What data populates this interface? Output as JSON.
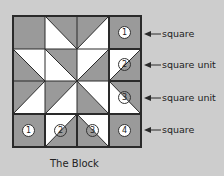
{
  "diagram": {
    "caption": "The Block",
    "colors": {
      "background": "#cdcdcd",
      "dark": "#9a9a9a",
      "light": "#ffffff",
      "line": "#2a2a2a"
    },
    "grid": {
      "rows": 4,
      "cols": 4
    },
    "labels": [
      {
        "text": "square",
        "row": 0
      },
      {
        "text": "square unit",
        "row": 1
      },
      {
        "text": "square unit",
        "row": 2
      },
      {
        "text": "square",
        "row": 3
      }
    ],
    "numbers": [
      {
        "text": "1",
        "row": 0,
        "col": 3
      },
      {
        "text": "2",
        "row": 1,
        "col": 3
      },
      {
        "text": "3",
        "row": 2,
        "col": 3
      },
      {
        "text": "1",
        "row": 3,
        "col": 0
      },
      {
        "text": "2",
        "row": 3,
        "col": 1
      },
      {
        "text": "3",
        "row": 3,
        "col": 2
      },
      {
        "text": "4",
        "row": 3,
        "col": 3
      }
    ]
  }
}
